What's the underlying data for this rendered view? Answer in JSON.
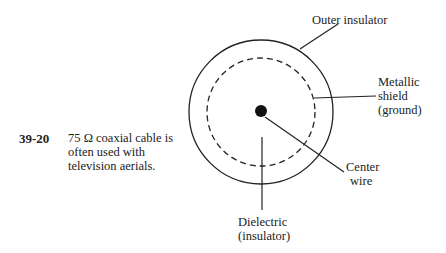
{
  "figure": {
    "number": "39-20",
    "caption_lines": [
      "75 Ω coaxial cable is",
      "often used with",
      "television aerials."
    ]
  },
  "labels": {
    "outer_insulator": "Outer insulator",
    "metallic_shield_1": "Metallic",
    "metallic_shield_2": "shield",
    "metallic_shield_3": "(ground)",
    "center_wire_1": "Center",
    "center_wire_2": "wire",
    "dielectric_1": "Dielectric",
    "dielectric_2": "(insulator)"
  }
}
